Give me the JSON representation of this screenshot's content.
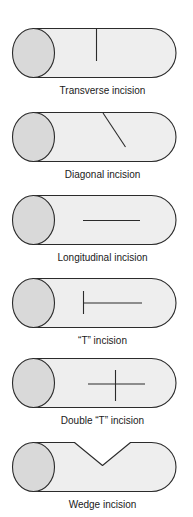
{
  "figure": {
    "colors": {
      "background": "#ffffff",
      "outline": "#2b2b2b",
      "end_face_fill": "#d9d9d9",
      "body_fill": "#eeeeee",
      "incision_line": "#2b2b2b",
      "label_text": "#1a1a1a"
    },
    "rows": [
      {
        "label": "Transverse incision",
        "incision": "transverse"
      },
      {
        "label": "Diagonal incision",
        "incision": "diagonal"
      },
      {
        "label": "Longitudinal incision",
        "incision": "longitudinal"
      },
      {
        "label": "“T” incision",
        "incision": "t"
      },
      {
        "label": "Double “T” incision",
        "incision": "double-t"
      },
      {
        "label": "Wedge incision",
        "incision": "wedge"
      }
    ]
  }
}
